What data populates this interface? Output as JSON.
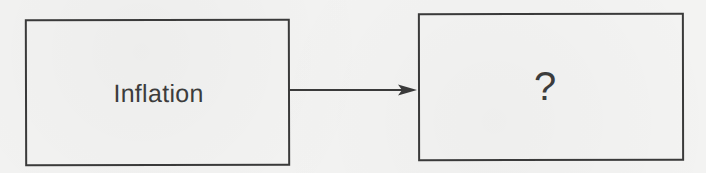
{
  "diagram": {
    "type": "flow",
    "nodes": [
      {
        "id": "source",
        "label": "Inflation"
      },
      {
        "id": "target",
        "label": "?"
      }
    ],
    "edges": [
      {
        "from": "source",
        "to": "target",
        "style": "solid-arrow"
      }
    ],
    "colors": {
      "stroke": "#3a3a3a",
      "text": "#3c3c3c",
      "background": "#f3f3f2"
    }
  }
}
